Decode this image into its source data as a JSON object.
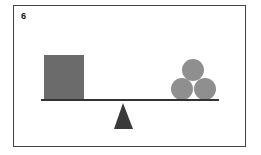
{
  "puzzle": {
    "number": "6",
    "left_object": {
      "shape": "square",
      "color": "#6b6b6b"
    },
    "right_objects": {
      "shape": "circle",
      "count": 3,
      "color": "#8f8f8f"
    },
    "beam_color": "#333333",
    "fulcrum_color": "#3a3a3a"
  }
}
